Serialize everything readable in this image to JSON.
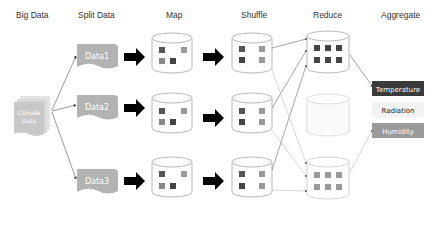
{
  "headers": {
    "big_data": "Big Data",
    "split_data": "Split Data",
    "map": "Map",
    "shuffle": "Shuffle",
    "reduce": "Reduce",
    "aggregate": "Aggregate"
  },
  "source": {
    "label_line1": "Climate",
    "label_line2": "Data",
    "icon": "stacked-documents-icon"
  },
  "splits": [
    {
      "label": "Data1"
    },
    {
      "label": "Data2"
    },
    {
      "label": "Data3"
    }
  ],
  "outputs": [
    {
      "label": "Temperature",
      "bg": "#3a3a3a",
      "fg": "#ffffff"
    },
    {
      "label": "Radiation",
      "bg": "#f2f2f2",
      "fg": "#222222"
    },
    {
      "label": "Humidity",
      "bg": "#9a9a9a",
      "fg": "#ffffff"
    }
  ],
  "colors": {
    "split_doc": "#b3b3b3",
    "source_doc": "#c8c8c8",
    "cylinder_stroke": "#9a9a9a",
    "dark_square": "#4a4a4a",
    "mid_square": "#8a8a8a",
    "arrow": "#000000",
    "line": "#666666"
  }
}
